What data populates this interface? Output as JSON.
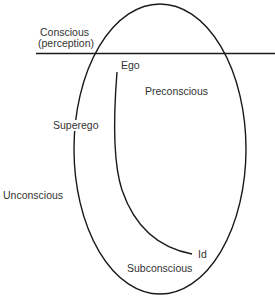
{
  "diagram": {
    "title": "",
    "labels": {
      "conscious_line1": "Conscious",
      "conscious_line2": "(perception)",
      "ego": "Ego",
      "preconscious": "Preconscious",
      "superego": "Superego",
      "unconscious": "Unconscious",
      "id": "Id",
      "subconscious": "Subconscious"
    },
    "colors": {
      "stroke": "#1a1a1a",
      "text": "#333333",
      "background": "#ffffff"
    }
  }
}
